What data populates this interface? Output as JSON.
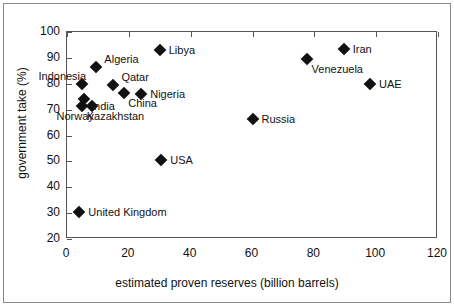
{
  "chart_data": {
    "type": "scatter",
    "title": "",
    "xlabel": "estimated proven reserves  (billion barrels)",
    "ylabel": "government take (%)",
    "xlim": [
      0,
      120
    ],
    "ylim": [
      20,
      100
    ],
    "xticks": [
      0,
      20,
      40,
      60,
      80,
      100,
      120
    ],
    "yticks": [
      20,
      30,
      40,
      50,
      60,
      70,
      80,
      90,
      100
    ],
    "grid": false,
    "legend": "none",
    "marker": "filled-diamond",
    "marker_color": "#111111",
    "points": [
      {
        "label": "United Kingdom",
        "x": 4,
        "y": 30.5,
        "label_dx": 9,
        "label_dy": 0
      },
      {
        "label": "Norway",
        "x": 5,
        "y": 71.5,
        "label_dx": -26,
        "label_dy": 10
      },
      {
        "label": "Indonesia",
        "x": 5,
        "y": 80,
        "label_dx": -44,
        "label_dy": -8
      },
      {
        "label": "India",
        "x": 5.5,
        "y": 74,
        "label_dx": 7,
        "label_dy": 7
      },
      {
        "label": "Kazakhstan",
        "x": 8,
        "y": 71.5,
        "label_dx": -5,
        "label_dy": 10
      },
      {
        "label": "Algeria",
        "x": 9.5,
        "y": 86.5,
        "label_dx": 8,
        "label_dy": -8
      },
      {
        "label": "Qatar",
        "x": 15,
        "y": 79.5,
        "label_dx": 8,
        "label_dy": -8
      },
      {
        "label": "China",
        "x": 18.5,
        "y": 76.5,
        "label_dx": 4,
        "label_dy": 10
      },
      {
        "label": "Nigeria",
        "x": 24,
        "y": 76,
        "label_dx": 9,
        "label_dy": 0
      },
      {
        "label": "Libya",
        "x": 30,
        "y": 93,
        "label_dx": 9,
        "label_dy": 0
      },
      {
        "label": "USA",
        "x": 30.5,
        "y": 50.5,
        "label_dx": 9,
        "label_dy": 0
      },
      {
        "label": "Russia",
        "x": 60,
        "y": 66.5,
        "label_dx": 9,
        "label_dy": 0
      },
      {
        "label": "Venezuela",
        "x": 77.5,
        "y": 89.5,
        "label_dx": 5,
        "label_dy": 10
      },
      {
        "label": "Iran",
        "x": 89.5,
        "y": 93.5,
        "label_dx": 9,
        "label_dy": 0
      },
      {
        "label": "UAE",
        "x": 98,
        "y": 80,
        "label_dx": 9,
        "label_dy": 0
      }
    ]
  }
}
